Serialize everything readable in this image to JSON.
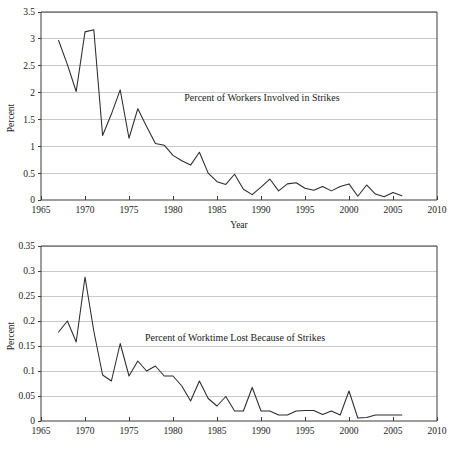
{
  "figure": {
    "background": "#ffffff",
    "line_color": "#2b2b2b",
    "grid_color": "#c9c9c9",
    "axis_color": "#3c3c3c",
    "clipped_top_text": ""
  },
  "chart_data": [
    {
      "id": "workers-involved",
      "type": "line",
      "title": "",
      "annotation": "Percent of Workers Involved in Strikes",
      "xlabel": "Year",
      "ylabel": "Percent",
      "xlim": [
        1965,
        2010
      ],
      "ylim": [
        0,
        3.5
      ],
      "xticks": [
        1965,
        1970,
        1975,
        1980,
        1985,
        1990,
        1995,
        2000,
        2005,
        2010
      ],
      "xticklabels": [
        "1965",
        "1970",
        "1975",
        "1980",
        "1985",
        "1990",
        "1995",
        "2000",
        "2005",
        "2010"
      ],
      "yticks": [
        0,
        0.5,
        1,
        1.5,
        2,
        2.5,
        3,
        3.5
      ],
      "yticklabels": [
        "0",
        "0.5",
        "1",
        "1.5",
        "2",
        "2.5",
        "3",
        "3.5"
      ],
      "grid": true,
      "legend": "none",
      "x": [
        1967,
        1968,
        1969,
        1970,
        1971,
        1972,
        1973,
        1974,
        1975,
        1976,
        1977,
        1978,
        1979,
        1980,
        1981,
        1982,
        1983,
        1984,
        1985,
        1986,
        1987,
        1988,
        1989,
        1990,
        1991,
        1992,
        1993,
        1994,
        1995,
        1996,
        1997,
        1998,
        1999,
        2000,
        2001,
        2002,
        2003,
        2004,
        2005,
        2006
      ],
      "values": [
        2.97,
        2.52,
        2.02,
        3.13,
        3.17,
        1.2,
        1.6,
        2.05,
        1.15,
        1.7,
        1.37,
        1.05,
        1.02,
        0.83,
        0.73,
        0.65,
        0.89,
        0.5,
        0.34,
        0.29,
        0.48,
        0.2,
        0.1,
        0.24,
        0.39,
        0.17,
        0.3,
        0.32,
        0.22,
        0.18,
        0.25,
        0.17,
        0.25,
        0.3,
        0.07,
        0.28,
        0.11,
        0.06,
        0.14,
        0.08
      ]
    },
    {
      "id": "worktime-lost",
      "type": "line",
      "title": "",
      "annotation": "Percent of Worktime Lost Because of Strikes",
      "xlabel": "",
      "ylabel": "Percent",
      "xlim": [
        1965,
        2010
      ],
      "ylim": [
        0,
        0.35
      ],
      "xticks": [
        1965,
        1970,
        1975,
        1980,
        1985,
        1990,
        1995,
        2000,
        2005,
        2010
      ],
      "xticklabels": [
        "1965",
        "1970",
        "1975",
        "1980",
        "1985",
        "1990",
        "1995",
        "2000",
        "2005",
        "2010"
      ],
      "yticks": [
        0,
        0.05,
        0.1,
        0.15,
        0.2,
        0.25,
        0.3,
        0.35
      ],
      "yticklabels": [
        "0",
        "0.05",
        "0.1",
        "0.15",
        "0.2",
        "0.25",
        "0.3",
        "0.35"
      ],
      "grid": true,
      "legend": "none",
      "x": [
        1967,
        1968,
        1969,
        1970,
        1971,
        1972,
        1973,
        1974,
        1975,
        1976,
        1977,
        1978,
        1979,
        1980,
        1981,
        1982,
        1983,
        1984,
        1985,
        1986,
        1987,
        1988,
        1989,
        1990,
        1991,
        1992,
        1993,
        1994,
        1995,
        1996,
        1997,
        1998,
        1999,
        2000,
        2001,
        2002,
        2003,
        2004,
        2005,
        2006
      ],
      "values": [
        0.178,
        0.2,
        0.158,
        0.288,
        0.18,
        0.092,
        0.08,
        0.155,
        0.09,
        0.12,
        0.1,
        0.11,
        0.09,
        0.09,
        0.07,
        0.04,
        0.08,
        0.045,
        0.03,
        0.049,
        0.02,
        0.02,
        0.067,
        0.02,
        0.02,
        0.012,
        0.012,
        0.02,
        0.021,
        0.021,
        0.013,
        0.02,
        0.012,
        0.06,
        0.006,
        0.007,
        0.012,
        0.012,
        0.012,
        0.012
      ]
    }
  ]
}
